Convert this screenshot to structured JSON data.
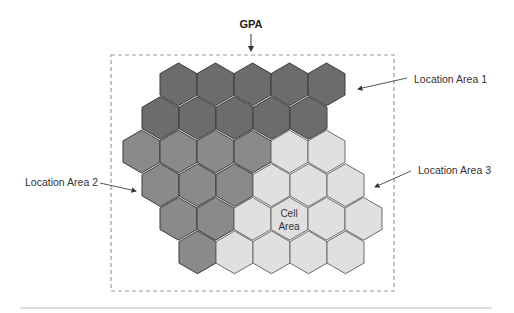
{
  "diagram": {
    "title": "GPA",
    "labels": {
      "la1": "Location Area 1",
      "la2": "Location Area 2",
      "la3": "Location Area 3",
      "cell_line1": "Cell",
      "cell_line2": "Area"
    },
    "colors": {
      "la1": "#6c6c6c",
      "la2": "#8a8a8a",
      "la3": "#e0e0e0",
      "hex_stroke": "#3a3a3a",
      "hex_stroke_light": "#6a6a6a",
      "dashed_border": "#9a9a9a",
      "rule": "#bbbbbb"
    },
    "grid": {
      "hex_width": 37,
      "row_height": 33.6,
      "top_y": 63,
      "rows": [
        {
          "left": 160,
          "cells": [
            "la1",
            "la1",
            "la1",
            "la1",
            "la1"
          ]
        },
        {
          "left": 142,
          "cells": [
            "la1",
            "la1",
            "la1",
            "la1",
            "la1"
          ]
        },
        {
          "left": 123,
          "cells": [
            "la2",
            "la2",
            "la2",
            "la2",
            "la3",
            "la3"
          ]
        },
        {
          "left": 142,
          "cells": [
            "la2",
            "la2",
            "la2",
            "la3",
            "la3",
            "la3"
          ]
        },
        {
          "left": 160,
          "cells": [
            "la2",
            "la2",
            "la3",
            "la3",
            "la3",
            "la3"
          ]
        },
        {
          "left": 179,
          "cells": [
            "la2",
            "la3",
            "la3",
            "la3",
            "la3"
          ]
        }
      ]
    }
  }
}
